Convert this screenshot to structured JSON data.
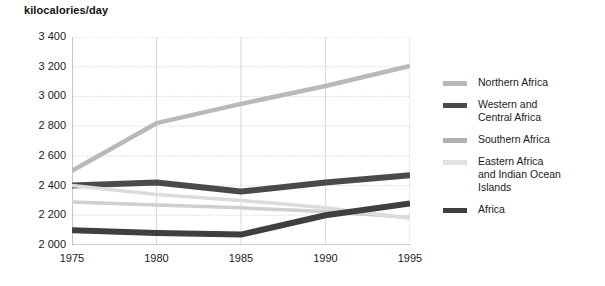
{
  "chart_data": {
    "type": "line",
    "title": "kilocalories/day",
    "xlabel": "",
    "ylabel": "kilocalories/day",
    "x": [
      1975,
      1980,
      1985,
      1990,
      1995
    ],
    "xlim": [
      1975,
      1995
    ],
    "ylim": [
      2000,
      3400
    ],
    "yticks": [
      2000,
      2200,
      2400,
      2600,
      2800,
      3000,
      3200,
      3400
    ],
    "ytick_labels": [
      "2 000",
      "2 200",
      "2 400",
      "2 600",
      "2 800",
      "3 000",
      "3 200",
      "3 400"
    ],
    "xtick_labels": [
      "1975",
      "1980",
      "1985",
      "1990",
      "1995"
    ],
    "grid": true,
    "legend_position": "right",
    "series": [
      {
        "name": "Northern Africa",
        "values": [
          2500,
          2820,
          2950,
          3070,
          3205
        ],
        "color": "#b9b9b9",
        "width": 4.5
      },
      {
        "name": "Western and\nCentral Africa",
        "values": [
          2400,
          2420,
          2360,
          2420,
          2470
        ],
        "color": "#4a4a4a",
        "width": 6
      },
      {
        "name": "Southern Africa",
        "values": [
          2290,
          2270,
          2250,
          2225,
          2185
        ],
        "color": "#cfcfcf",
        "width": 3.5
      },
      {
        "name": "Eastern Africa\nand Indian Ocean\nIslands",
        "values": [
          2400,
          2340,
          2300,
          2250,
          2180
        ],
        "color": "#dcdcdc",
        "width": 3.5
      },
      {
        "name": "Africa",
        "values": [
          2100,
          2080,
          2070,
          2200,
          2280
        ],
        "color": "#3f3f3f",
        "width": 6
      }
    ]
  },
  "legend": {
    "items": [
      {
        "label": "Northern Africa",
        "swatch": "#b9b9b9"
      },
      {
        "label": "Western and\nCentral Africa",
        "swatch": "#4a4a4a"
      },
      {
        "label": "Southern Africa",
        "swatch": "#b0b0b0"
      },
      {
        "label": "Eastern Africa\nand Indian Ocean\nIslands",
        "swatch": "#e2e2e2"
      },
      {
        "label": "Africa",
        "swatch": "#3f3f3f"
      }
    ]
  }
}
